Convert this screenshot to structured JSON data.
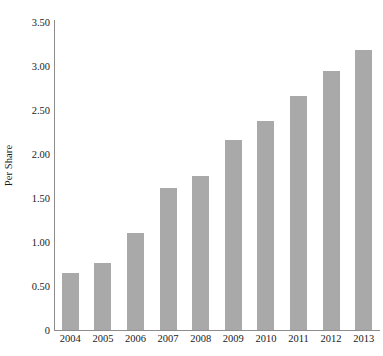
{
  "chart_data": {
    "type": "bar",
    "title": "",
    "subtitle": "",
    "xlabel": "",
    "ylabel": "Per Share",
    "categories": [
      "2004",
      "2005",
      "2006",
      "2007",
      "2008",
      "2009",
      "2010",
      "2011",
      "2012",
      "2013"
    ],
    "values": [
      0.65,
      0.76,
      1.1,
      1.61,
      1.75,
      2.16,
      2.38,
      2.66,
      2.94,
      3.18
    ],
    "ylim": [
      0,
      3.5
    ],
    "ytick_values": [
      0,
      0.5,
      1.0,
      1.5,
      2.0,
      2.5,
      3.0,
      3.5
    ],
    "ytick_labels": [
      "0",
      "0.50",
      "1.00",
      "1.50",
      "2.00",
      "2.50",
      "3.00",
      "3.50"
    ],
    "grid": false,
    "legend": false,
    "legend_position": "none",
    "bar_color": "#a9a9a9",
    "axis_color": "#8d8d8d",
    "text_color": "#1a1a1a",
    "background_color": "#ffffff"
  }
}
